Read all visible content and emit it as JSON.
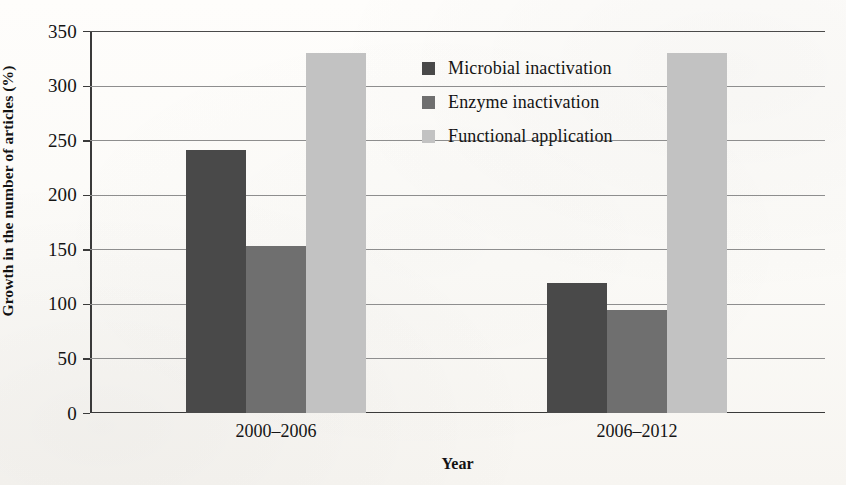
{
  "chart_data": {
    "type": "bar",
    "title": "",
    "xlabel": "Year",
    "ylabel": "Growth in the number of articles (%)",
    "categories": [
      "2000–2006",
      "2006–2012"
    ],
    "series": [
      {
        "name": "Microbial inactivation",
        "values": [
          241,
          119
        ],
        "color": "#494949"
      },
      {
        "name": "Enzyme inactivation",
        "values": [
          153,
          94
        ],
        "color": "#6f6f6f"
      },
      {
        "name": "Functional application",
        "values": [
          330,
          330
        ],
        "color": "#c2c2c2"
      }
    ],
    "ylim": [
      0,
      350
    ],
    "yticks": [
      0,
      50,
      100,
      150,
      200,
      250,
      300,
      350
    ],
    "ytick_labels": [
      "0",
      "50",
      "100",
      "150",
      "200",
      "250",
      "300",
      "350"
    ],
    "grid": true,
    "legend_position": "upper-center-left-inside"
  },
  "axis": {
    "y_title": "Growth in the number of articles (%)",
    "x_title": "Year"
  }
}
